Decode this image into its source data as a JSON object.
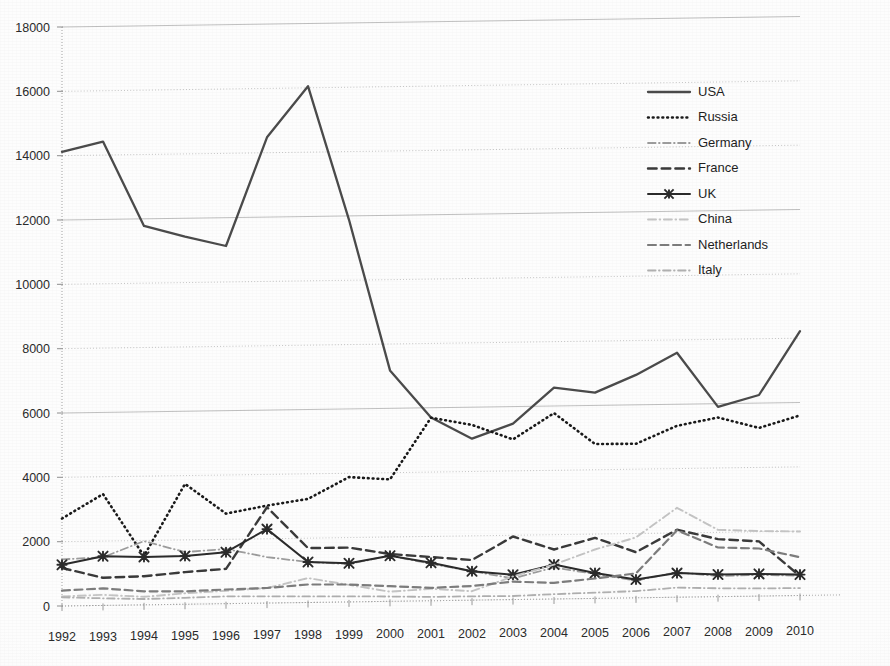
{
  "chart_data": {
    "type": "line",
    "title": "",
    "subtitle": "",
    "xlabel": "",
    "ylabel": "",
    "x": [
      1992,
      1993,
      1994,
      1995,
      1996,
      1997,
      1998,
      1999,
      2000,
      2001,
      2002,
      2003,
      2004,
      2005,
      2006,
      2007,
      2008,
      2009,
      2010
    ],
    "categories": [
      "1992",
      "1993",
      "1994",
      "1995",
      "1996",
      "1997",
      "1998",
      "1999",
      "2000",
      "2001",
      "2002",
      "2003",
      "2004",
      "2005",
      "2006",
      "2007",
      "2008",
      "2009",
      "2010"
    ],
    "xlim": [
      1992,
      2010
    ],
    "ylim": [
      0,
      18000
    ],
    "ytick_values": [
      0,
      2000,
      4000,
      6000,
      8000,
      10000,
      12000,
      14000,
      16000,
      18000
    ],
    "ytick_labels": [
      "0",
      "2000",
      "4000",
      "6000",
      "8000",
      "10000",
      "12000",
      "14000",
      "16000",
      "18000"
    ],
    "grid": true,
    "grid_axis": "y",
    "legend_position": "right-inside-top",
    "series": [
      {
        "name": "USA",
        "style": "solid",
        "color": "#4b4b4b",
        "width": 2.3,
        "marker": "none",
        "values": [
          14120,
          14420,
          11780,
          11430,
          11120,
          14480,
          16050,
          11880,
          7180,
          5700,
          5020,
          5470,
          6570,
          6400,
          6930,
          7600,
          5900,
          6250,
          8220
        ]
      },
      {
        "name": "Russia",
        "style": "dotted",
        "color": "#1a1a1a",
        "width": 2.6,
        "marker": "none",
        "values": [
          2720,
          3460,
          1520,
          3740,
          2800,
          3030,
          3220,
          3880,
          3790,
          5690,
          5450,
          4980,
          5780,
          4800,
          4790,
          5330,
          5570,
          5230,
          5600
        ]
      },
      {
        "name": "Germany",
        "style": "dashdot",
        "color": "#9d9d9d",
        "width": 1.8,
        "marker": "none",
        "values": [
          1450,
          1500,
          1980,
          1620,
          1700,
          1430,
          1260,
          1180,
          1420,
          1150,
          900,
          660,
          980,
          760,
          540,
          780,
          640,
          660,
          620
        ]
      },
      {
        "name": "France",
        "style": "dashed",
        "color": "#3a3a3a",
        "width": 2.4,
        "marker": "none",
        "values": [
          1180,
          860,
          890,
          1000,
          1080,
          2980,
          1690,
          1690,
          1470,
          1360,
          1250,
          1960,
          1540,
          1880,
          1420,
          2100,
          1790,
          1700,
          600
        ]
      },
      {
        "name": "UK",
        "style": "solid",
        "color": "#2b2b2b",
        "width": 2.0,
        "marker": "x",
        "values": [
          1280,
          1530,
          1490,
          1500,
          1600,
          2300,
          1260,
          1200,
          1420,
          1180,
          900,
          770,
          1070,
          790,
          570,
          750,
          690,
          690,
          650
        ]
      },
      {
        "name": "China",
        "style": "dashdot",
        "color": "#c4c4c4",
        "width": 1.9,
        "marker": "none",
        "values": [
          300,
          330,
          250,
          340,
          400,
          470,
          760,
          530,
          300,
          370,
          280,
          720,
          1070,
          1520,
          1880,
          2780,
          2080,
          2020,
          1990
        ]
      },
      {
        "name": "Netherlands",
        "style": "dashed",
        "color": "#7d7d7d",
        "width": 2.2,
        "marker": "none",
        "values": [
          480,
          530,
          420,
          400,
          440,
          470,
          560,
          540,
          470,
          400,
          440,
          560,
          500,
          620,
          760,
          2080,
          1530,
          1480,
          1190
        ]
      },
      {
        "name": "Italy",
        "style": "dashdot",
        "color": "#b0b0b0",
        "width": 1.8,
        "marker": "none",
        "values": [
          270,
          220,
          180,
          200,
          230,
          210,
          190,
          170,
          150,
          120,
          120,
          110,
          150,
          180,
          210,
          300,
          260,
          240,
          230
        ]
      }
    ]
  },
  "legend": {
    "items": [
      {
        "label": "USA"
      },
      {
        "label": "Russia"
      },
      {
        "label": "Germany"
      },
      {
        "label": "France"
      },
      {
        "label": "UK"
      },
      {
        "label": "China"
      },
      {
        "label": "Netherlands"
      },
      {
        "label": "Italy"
      }
    ]
  }
}
